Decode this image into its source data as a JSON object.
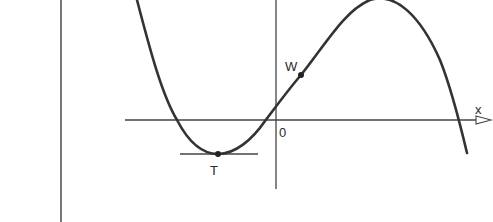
{
  "figure": {
    "type": "function-graph",
    "colors": {
      "curve": "#333333",
      "axis": "#444444",
      "background": "#ffffff"
    }
  },
  "labels": {
    "x_axis": "x",
    "origin": "0",
    "inflection_point": "W",
    "minimum_point": "T"
  },
  "points": [
    {
      "name": "T",
      "role": "local minimum",
      "px": [
        218,
        154
      ]
    },
    {
      "name": "W",
      "role": "inflection point",
      "px": [
        301,
        75
      ]
    }
  ]
}
